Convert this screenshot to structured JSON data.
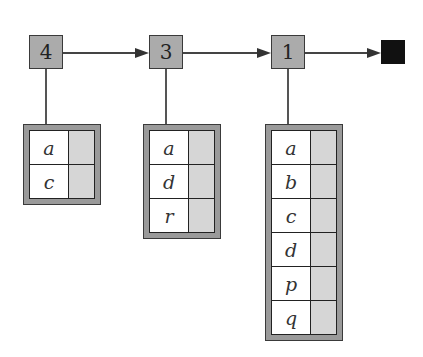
{
  "diagram": {
    "nodes": [
      {
        "label": "4",
        "keys": [
          "a",
          "c"
        ]
      },
      {
        "label": "3",
        "keys": [
          "a",
          "d",
          "r"
        ]
      },
      {
        "label": "1",
        "keys": [
          "a",
          "b",
          "c",
          "d",
          "p",
          "q"
        ]
      }
    ],
    "terminal": "null-terminator",
    "colors": {
      "node_fill": "#ababab",
      "node_border": "#3a3a3a",
      "table_frame": "#9a9a9a",
      "value_cell": "#d6d6d6",
      "terminal_fill": "#111111"
    }
  }
}
